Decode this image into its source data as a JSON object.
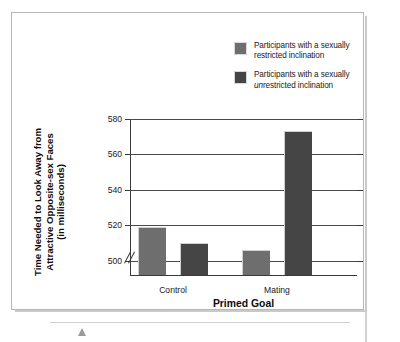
{
  "figure": {
    "legend": {
      "items": [
        {
          "label_line1": "Participants with a sexually",
          "label_prefix_italic": "",
          "label_line2": "restricted inclination",
          "color": "#6e6e6e"
        },
        {
          "label_line1": "Participants with a sexually",
          "label_prefix_italic": "un",
          "label_line2": "restricted inclination",
          "color": "#454545"
        }
      ]
    }
  },
  "chart_data": {
    "type": "bar",
    "title": "",
    "xlabel": "Primed Goal",
    "ylabel": "Time Needed to Look Away from Attractive Opposite-sex Faces (in milliseconds)",
    "ylabel_line1": "Time Needed to Look Away from",
    "ylabel_line2": "Attractive Opposite-sex Faces",
    "ylabel_line3": "(in milliseconds)",
    "categories": [
      "Control",
      "Mating"
    ],
    "yticks": [
      500,
      520,
      540,
      560,
      580
    ],
    "ylim": [
      492,
      580
    ],
    "axis_break": true,
    "grid": true,
    "legend_position": "top-right",
    "series": [
      {
        "name": "Participants with a sexually restricted inclination",
        "color": "#6e6e6e",
        "values": [
          519,
          506
        ]
      },
      {
        "name": "Participants with a sexually unrestricted inclination",
        "color": "#454545",
        "values": [
          510,
          573
        ]
      }
    ]
  }
}
